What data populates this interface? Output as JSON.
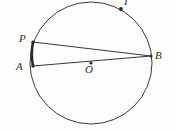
{
  "figure": {
    "kind": "circle-geometry-diagram",
    "canvas": {
      "width": 175,
      "height": 132
    },
    "background_color": "#fdfdfc",
    "stroke_color": "#3a3a3a",
    "label_color": "#2b2b2b",
    "circle": {
      "name": "main-circle",
      "center_x": 91,
      "center_y": 63,
      "radius": 61,
      "stroke_width": 1
    },
    "points": [
      {
        "id": "P",
        "label": "P",
        "x": 33,
        "y": 42,
        "dot": true,
        "dot_r": 1.6
      },
      {
        "id": "A",
        "label": "A",
        "x": 33,
        "y": 66,
        "dot": true,
        "dot_r": 1.6
      },
      {
        "id": "B",
        "label": "B",
        "x": 151,
        "y": 56,
        "dot": true,
        "dot_r": 1.6
      },
      {
        "id": "O",
        "label": "O",
        "x": 91,
        "y": 63,
        "dot": true,
        "dot_r": 1.6
      },
      {
        "id": "I",
        "label": "I",
        "x": 121,
        "y": 9,
        "dot": true,
        "dot_r": 1.9
      }
    ],
    "segments": [
      {
        "id": "PB",
        "name": "chord-p-b",
        "from": "P",
        "to": "B",
        "stroke_width": 1.2
      },
      {
        "id": "AB",
        "name": "diameter-a-b",
        "from": "A",
        "to": "B",
        "stroke_width": 1.2
      }
    ],
    "arcs": [
      {
        "id": "arc-PA",
        "name": "highlighted-arc-p-a",
        "from": "P",
        "to": "A",
        "stroke_width": 2.6,
        "emphasis": true
      }
    ],
    "labels": {
      "P": "P",
      "A": "A",
      "B": "B",
      "O": "O",
      "I": "I"
    }
  }
}
